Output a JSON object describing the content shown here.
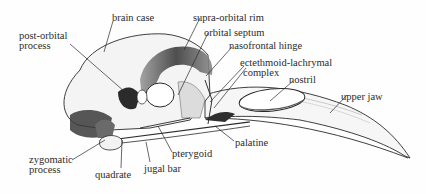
{
  "diagram": {
    "labels": [
      {
        "id": "brain-case",
        "text": "brain case",
        "x": 112,
        "y": 13
      },
      {
        "id": "post-orbital-process-1",
        "text": "post-orbital",
        "x": 19,
        "y": 31
      },
      {
        "id": "post-orbital-process-2",
        "text": "process",
        "x": 19,
        "y": 41
      },
      {
        "id": "supra-orbital-rim",
        "text": "supra-orbital rim",
        "x": 193,
        "y": 13
      },
      {
        "id": "orbital-septum",
        "text": "orbital septum",
        "x": 204,
        "y": 28
      },
      {
        "id": "nasofrontal-hinge",
        "text": "nasofrontal hinge",
        "x": 229,
        "y": 41
      },
      {
        "id": "ectethmoid-lachrymal-1",
        "text": "ectethmoid-lachrymal",
        "x": 240,
        "y": 58
      },
      {
        "id": "ectethmoid-lachrymal-2",
        "text": "complex",
        "x": 243,
        "y": 68
      },
      {
        "id": "nostril",
        "text": "nostril",
        "x": 289,
        "y": 75
      },
      {
        "id": "upper-jaw",
        "text": "upper jaw",
        "x": 341,
        "y": 92
      },
      {
        "id": "palatine",
        "text": "palatine",
        "x": 235,
        "y": 138
      },
      {
        "id": "pterygoid",
        "text": "pterygoid",
        "x": 172,
        "y": 149
      },
      {
        "id": "jugal-bar",
        "text": "jugal bar",
        "x": 144,
        "y": 164
      },
      {
        "id": "quadrate",
        "text": "quadrate",
        "x": 95,
        "y": 170
      },
      {
        "id": "zygomatic-process-1",
        "text": "zygomatic",
        "x": 29,
        "y": 155
      },
      {
        "id": "zygomatic-process-2",
        "text": "process",
        "x": 29,
        "y": 165
      }
    ],
    "colors": {
      "ink": "#2a2a2a",
      "bone": "#f2f2f2",
      "shadow": "#5a5a5a",
      "dark": "#1e1e1e",
      "background": "#fefefe"
    }
  }
}
